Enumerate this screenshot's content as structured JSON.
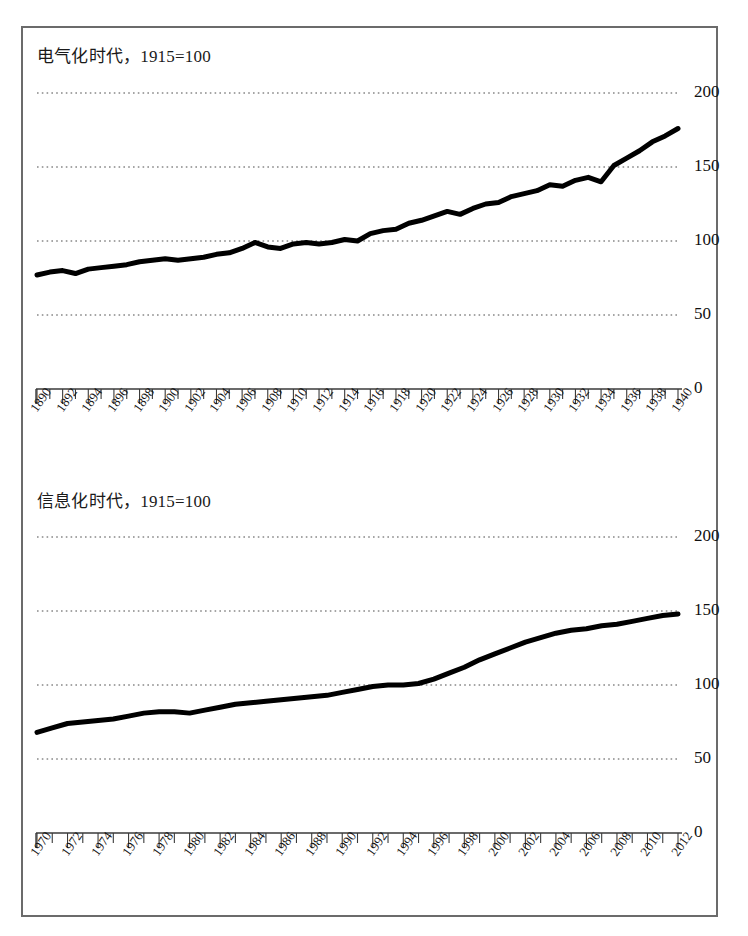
{
  "figure": {
    "background": "#ffffff",
    "frame_color": "#6b6b6b",
    "line_color": "#000000",
    "gridline_color": "#4d4d4d"
  },
  "panels": [
    {
      "id": "electrification",
      "title": "电气化时代，1915=100",
      "y_axis": {
        "ticks": [
          "200",
          "150",
          "100",
          "50",
          "0"
        ],
        "tick_values": [
          200,
          150,
          100,
          50,
          0
        ],
        "min": 0,
        "max": 200
      },
      "x_axis": {
        "start": 1890,
        "end": 1940,
        "labels": [
          "1890",
          "1892",
          "1894",
          "1896",
          "1898",
          "1900",
          "1902",
          "1904",
          "1906",
          "1908",
          "1910",
          "1912",
          "1914",
          "1916",
          "1918",
          "1920",
          "1922",
          "1924",
          "1926",
          "1928",
          "1930",
          "1932",
          "1934",
          "1936",
          "1938",
          "1940"
        ]
      }
    },
    {
      "id": "information",
      "title": "信息化时代，1915=100",
      "y_axis": {
        "ticks": [
          "200",
          "150",
          "100",
          "50",
          "0"
        ],
        "tick_values": [
          200,
          150,
          100,
          50,
          0
        ],
        "min": 0,
        "max": 200
      },
      "x_axis": {
        "start": 1970,
        "end": 2012,
        "labels": [
          "1970",
          "1972",
          "1974",
          "1976",
          "1978",
          "1980",
          "1982",
          "1984",
          "1986",
          "1988",
          "1990",
          "1992",
          "1994",
          "1996",
          "1998",
          "2000",
          "2002",
          "2004",
          "2006",
          "2008",
          "2010",
          "2012"
        ]
      }
    }
  ],
  "chart_data": [
    {
      "type": "line",
      "title": "电气化时代，1915=100",
      "xlabel": "",
      "ylabel": "",
      "xlim": [
        1890,
        1940
      ],
      "ylim": [
        0,
        200
      ],
      "yticks": [
        0,
        50,
        100,
        150,
        200
      ],
      "grid": true,
      "legend": "none",
      "x": [
        1890,
        1891,
        1892,
        1893,
        1894,
        1895,
        1896,
        1897,
        1898,
        1899,
        1900,
        1901,
        1902,
        1903,
        1904,
        1905,
        1906,
        1907,
        1908,
        1909,
        1910,
        1911,
        1912,
        1913,
        1914,
        1915,
        1916,
        1917,
        1918,
        1919,
        1920,
        1921,
        1922,
        1923,
        1924,
        1925,
        1926,
        1927,
        1928,
        1929,
        1930,
        1931,
        1932,
        1933,
        1934,
        1935,
        1936,
        1937,
        1938,
        1939,
        1940
      ],
      "y": [
        77,
        79,
        80,
        78,
        81,
        82,
        83,
        84,
        86,
        87,
        88,
        87,
        88,
        89,
        91,
        92,
        95,
        99,
        96,
        95,
        98,
        99,
        98,
        99,
        101,
        100,
        105,
        107,
        108,
        112,
        114,
        117,
        120,
        118,
        122,
        125,
        126,
        130,
        132,
        134,
        138,
        137,
        141,
        143,
        140,
        151,
        156,
        161,
        167,
        171,
        176
      ]
    },
    {
      "type": "line",
      "title": "信息化时代，1915=100",
      "xlabel": "",
      "ylabel": "",
      "xlim": [
        1970,
        2012
      ],
      "ylim": [
        0,
        200
      ],
      "yticks": [
        0,
        50,
        100,
        150,
        200
      ],
      "grid": true,
      "legend": "none",
      "x": [
        1970,
        1971,
        1972,
        1973,
        1974,
        1975,
        1976,
        1977,
        1978,
        1979,
        1980,
        1981,
        1982,
        1983,
        1984,
        1985,
        1986,
        1987,
        1988,
        1989,
        1990,
        1991,
        1992,
        1993,
        1994,
        1995,
        1996,
        1997,
        1998,
        1999,
        2000,
        2001,
        2002,
        2003,
        2004,
        2005,
        2006,
        2007,
        2008,
        2009,
        2010,
        2011,
        2012
      ],
      "y": [
        68,
        71,
        74,
        75,
        76,
        77,
        79,
        81,
        82,
        82,
        81,
        83,
        85,
        87,
        88,
        89,
        90,
        91,
        92,
        93,
        95,
        97,
        99,
        100,
        100,
        101,
        104,
        108,
        112,
        117,
        121,
        125,
        129,
        132,
        135,
        137,
        138,
        140,
        141,
        143,
        145,
        147,
        148
      ]
    }
  ]
}
